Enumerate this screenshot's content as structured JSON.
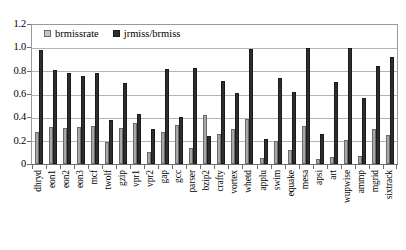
{
  "chart_data": {
    "type": "bar",
    "title": "",
    "xlabel": "",
    "ylabel": "",
    "ylim": [
      0,
      1.2
    ],
    "grid": true,
    "legend_position": "top-left",
    "y_ticks": [
      "0",
      "0.2",
      "0.4",
      "0.6",
      "0.8",
      "1.0",
      "1.2"
    ],
    "y_tick_values": [
      0,
      0.2,
      0.4,
      0.6,
      0.8,
      1.0,
      1.2
    ],
    "categories": [
      "dhryd",
      "eon1",
      "eon2",
      "eon3",
      "mcf",
      "twolf",
      "gzip",
      "vpr1",
      "vpr2",
      "gap",
      "gcc",
      "parser",
      "bzip2",
      "crafty",
      "vortex",
      "whetd",
      "applu",
      "swim",
      "equake",
      "mesa",
      "apsi",
      "art",
      "wupwise",
      "ammp",
      "mgrid",
      "sixtrack"
    ],
    "series": [
      {
        "name": "brmissrate",
        "color": "#a8a8a8",
        "values": [
          0.28,
          0.32,
          0.31,
          0.32,
          0.33,
          0.19,
          0.31,
          0.35,
          0.1,
          0.28,
          0.34,
          0.14,
          0.42,
          0.26,
          0.3,
          0.39,
          0.05,
          0.2,
          0.12,
          0.33,
          0.04,
          0.06,
          0.21,
          0.07,
          0.3,
          0.25
        ]
      },
      {
        "name": "jrmiss/brmiss",
        "color": "#2e2e2e",
        "values": [
          0.98,
          0.81,
          0.79,
          0.76,
          0.79,
          0.38,
          0.7,
          0.43,
          0.3,
          0.82,
          0.41,
          0.83,
          0.24,
          0.72,
          0.61,
          0.99,
          0.22,
          0.74,
          0.62,
          1.0,
          0.26,
          0.71,
          1.0,
          0.57,
          0.85,
          0.92
        ]
      }
    ]
  },
  "legend": {
    "items": [
      {
        "label": "brmissrate",
        "swatch": "light"
      },
      {
        "label": "jrmiss/brmiss",
        "swatch": "dark"
      }
    ]
  }
}
